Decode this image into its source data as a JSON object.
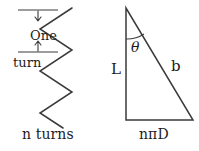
{
  "figure": {
    "background_color": "#ffffff",
    "stroke_color": "#3a3a3a",
    "text_color": "#1c1c1c"
  },
  "left_diagram": {
    "name": "zigzag-helix-side-view",
    "dimension_label_line1": "One",
    "dimension_label_line2": "turn",
    "caption": "n turns",
    "top_rule_y": 10,
    "bottom_rule_y": 52,
    "zigzag_points": "72,8 40,29 72,50 40,71 72,92 40,113 72,128",
    "zigzag_path": "M 72 8 L 40 29 L 72 50 L 40 71 L 72 92 L 40 113 L 63 128",
    "top_rule_path": "M 18 10 L 58 10",
    "bottom_rule_path": "M 18 52 L 58 52",
    "top_arrow_path": "M 38 11 L 38 20 M 35 17 L 38 21 L 41 17",
    "bottom_arrow_path": "M 38 51 L 38 42 M 35 45 L 38 41 L 41 45"
  },
  "right_diagram": {
    "name": "right-triangle",
    "apex_x": 126,
    "apex_y": 8,
    "base_left_x": 126,
    "base_y": 120,
    "base_right_x": 193,
    "triangle_path": "M 126 8 L 126 120 L 193 120 Z",
    "angle_arc_path": "M 126 39 A 31 31 0 0 0 144 34",
    "angle_symbol": "θ",
    "vertical_leg_label": "L",
    "hypotenuse_label": "b",
    "base_label": "nπD"
  }
}
